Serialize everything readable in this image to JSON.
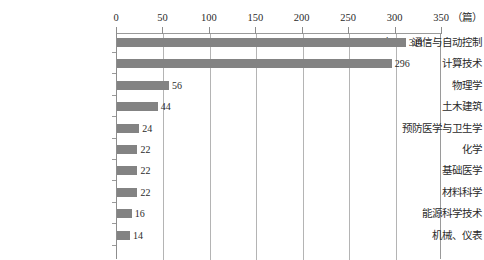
{
  "chart_data": {
    "type": "bar",
    "orientation": "horizontal",
    "title": "",
    "xlabel": "（篇）",
    "ylabel": "",
    "xlim": [
      0,
      350
    ],
    "grid": true,
    "legend": "none",
    "bar_color": "#838383",
    "axis_color": "#9a9a9a",
    "gridline_color": "#b4b4b4",
    "xticks": [
      "0",
      "50",
      "100",
      "150",
      "200",
      "250",
      "300",
      "350"
    ],
    "xtick_values": [
      0,
      50,
      100,
      150,
      200,
      250,
      300,
      350
    ],
    "categories": [
      "电子、通信与自动控制",
      "计算技术",
      "物理学",
      "土木建筑",
      "预防医学与卫生学",
      "化学",
      "基础医学",
      "材料科学",
      "能源科学技术",
      "机械、仪表"
    ],
    "values": [
      311,
      296,
      56,
      44,
      24,
      22,
      22,
      22,
      16,
      14
    ],
    "value_labels": [
      "311",
      "296",
      "56",
      "44",
      "24",
      "22",
      "22",
      "22",
      "16",
      "14"
    ]
  },
  "footer": {
    "note": ""
  }
}
